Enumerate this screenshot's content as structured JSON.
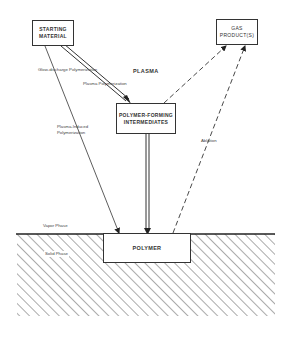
{
  "diagram": {
    "nodes": {
      "starting_material": "STARTING\nMATERIAL",
      "starting_material_line1": "STARTING",
      "starting_material_line2": "MATERIAL",
      "gas_products_line1": "GAS",
      "gas_products_line2": "PRODUCT(S)",
      "intermediates_line1": "POLYMER-FORMING",
      "intermediates_line2": "INTERMEDIATES",
      "polymer": "POLYMER"
    },
    "labels": {
      "glow_discharge": "Glow-discharge Polymerization",
      "plasma_polymerization": "Plasma Polymerization",
      "plasma": "PLASMA",
      "plasma_induced_line1": "Plasma-Induced",
      "plasma_induced_line2": "Polymerization",
      "ablation": "Ablation",
      "vapor_phase": "Vapor Phase",
      "solid_phase": "Solid Phase"
    },
    "edges": [
      {
        "from": "starting_material",
        "to": "intermediates",
        "style": "double-line",
        "label": "Plasma Polymerization"
      },
      {
        "from": "starting_material",
        "to": "polymer",
        "style": "solid",
        "label": "Plasma-Induced Polymerization"
      },
      {
        "from": "intermediates",
        "to": "polymer",
        "style": "double-line"
      },
      {
        "from": "intermediates",
        "to": "gas_products",
        "style": "dashed"
      },
      {
        "from": "polymer",
        "to": "gas_products",
        "style": "dashed",
        "label": "Ablation"
      }
    ]
  }
}
